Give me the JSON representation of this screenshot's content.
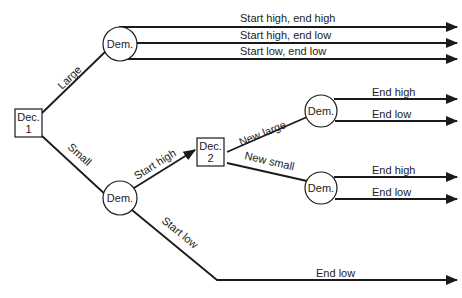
{
  "diagram": {
    "type": "decision-tree",
    "nodes": {
      "dec1": {
        "line1": "Dec.",
        "line2": "1"
      },
      "dem_large": {
        "label": "Dem."
      },
      "dem_small": {
        "label": "Dem."
      },
      "dec2": {
        "line1": "Dec.",
        "line2": "2"
      },
      "dem_new_large": {
        "label": "Dem."
      },
      "dem_new_small": {
        "label": "Dem."
      }
    },
    "edges": {
      "large": "Large",
      "small": "Small",
      "start_high": "Start high",
      "start_low": "Start low",
      "new_large": "New large",
      "new_small": "New small"
    },
    "outcomes": {
      "large_1": "Start high, end high",
      "large_2": "Start high, end low",
      "large_3": "Start low, end low",
      "new_large_high": "End high",
      "new_large_low": "End low",
      "new_small_high": "End high",
      "new_small_low": "End low",
      "start_low_end": "End low"
    }
  }
}
